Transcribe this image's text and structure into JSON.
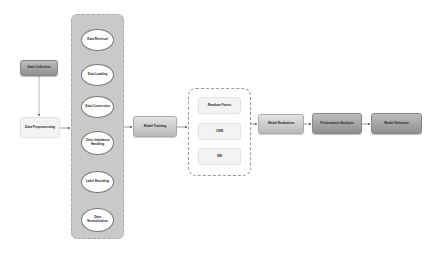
{
  "diagram": {
    "nodes": {
      "data_collection": "Data Collection",
      "data_preprocessing": "Data Preprocessing",
      "model_training": "Model Training",
      "model_evaluation": "Model Evaluation",
      "performance_analysis": "Performance Analysis",
      "model_selection": "Model Selection"
    },
    "preprocessing_steps": [
      {
        "label": "Data Retrieval"
      },
      {
        "label": "Data Loading"
      },
      {
        "label": "Data Conversion"
      },
      {
        "label": "Class Imbalance Handling"
      },
      {
        "label": "Label Encoding"
      },
      {
        "label": "Data Normalization"
      }
    ],
    "models": [
      {
        "label": "Random Forest"
      },
      {
        "label": "CNN"
      },
      {
        "label": "NN"
      }
    ],
    "edges": [
      [
        "Data Collection",
        "Data Preprocessing"
      ],
      [
        "Data Preprocessing",
        "Preprocessing Steps"
      ],
      [
        "Preprocessing Steps",
        "Model Training"
      ],
      [
        "Model Training",
        "Models"
      ],
      [
        "Models",
        "Model Evaluation"
      ],
      [
        "Model Evaluation",
        "Performance Analysis"
      ],
      [
        "Performance Analysis",
        "Model Selection"
      ]
    ]
  }
}
